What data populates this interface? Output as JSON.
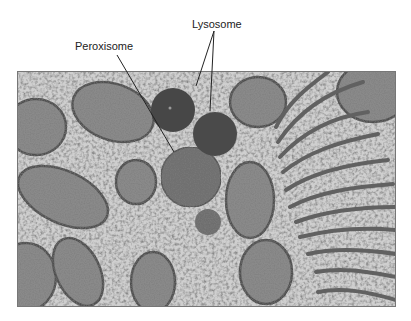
{
  "figure": {
    "type": "electron-micrograph",
    "labels": {
      "lysosome": "Lysosome",
      "peroxisome": "Peroxisome"
    },
    "palette": {
      "background": "#ffffff",
      "cytoplasm": "#c8c8c8",
      "organelle_dark": "#4a4a4a",
      "organelle_mid": "#6e6e6e",
      "membrane": "#555555",
      "leader_line": "#222222"
    }
  }
}
